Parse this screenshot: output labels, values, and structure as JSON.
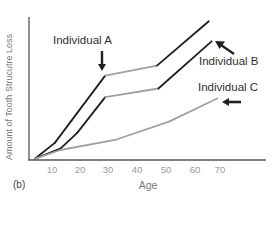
{
  "chart_data": {
    "type": "line",
    "title": "",
    "panel_label": "(b)",
    "xlabel": "Age",
    "ylabel": "Amount of Tooth Strucutre Loss",
    "x_ticks": [
      10,
      20,
      30,
      40,
      50,
      60,
      70
    ],
    "xlim": [
      0,
      88
    ],
    "ylim": [
      0,
      100
    ],
    "y_ticks": [],
    "grid": false,
    "legend": "annotations with arrows",
    "series": [
      {
        "name": "Individual A",
        "color": "#1f1f1f",
        "x": [
          4,
          11,
          29,
          47.5,
          66
        ],
        "y": [
          1,
          12,
          59,
          66,
          97
        ],
        "segment_colors": [
          "#1f1f1f",
          "#1f1f1f",
          "#a0a0a0",
          "#1f1f1f"
        ]
      },
      {
        "name": "Individual B",
        "color": "#1f1f1f",
        "x": [
          4,
          13,
          19,
          29,
          48,
          67
        ],
        "y": [
          1,
          8,
          19,
          44,
          50,
          83
        ],
        "segment_colors": [
          "#1f1f1f",
          "#1f1f1f",
          "#1f1f1f",
          "#a0a0a0",
          "#1f1f1f"
        ]
      },
      {
        "name": "Individual C",
        "color": "#a0a0a0",
        "x": [
          4,
          13,
          32.5,
          52,
          69
        ],
        "y": [
          1,
          7,
          14,
          27,
          43
        ],
        "segment_colors": [
          "#a0a0a0",
          "#a0a0a0",
          "#a0a0a0",
          "#a0a0a0"
        ]
      }
    ],
    "annotations": [
      {
        "text": "Individual A",
        "arrow": "down",
        "points_to": "Individual A at age ~29"
      },
      {
        "text": "Individual B",
        "arrow": "up-left",
        "points_to": "end of Individual B"
      },
      {
        "text": "Individual C",
        "arrow": "left",
        "points_to": "end of Individual C"
      }
    ]
  },
  "labels": {
    "panel": "(b)",
    "xlabel": "Age",
    "ylabel": "Amount of Tooth Strucutre Loss",
    "ann_a": "Individual A",
    "ann_b": "Individual B",
    "ann_c": "Individual C",
    "ticks": [
      "10",
      "20",
      "30",
      "40",
      "50",
      "60",
      "70"
    ]
  }
}
